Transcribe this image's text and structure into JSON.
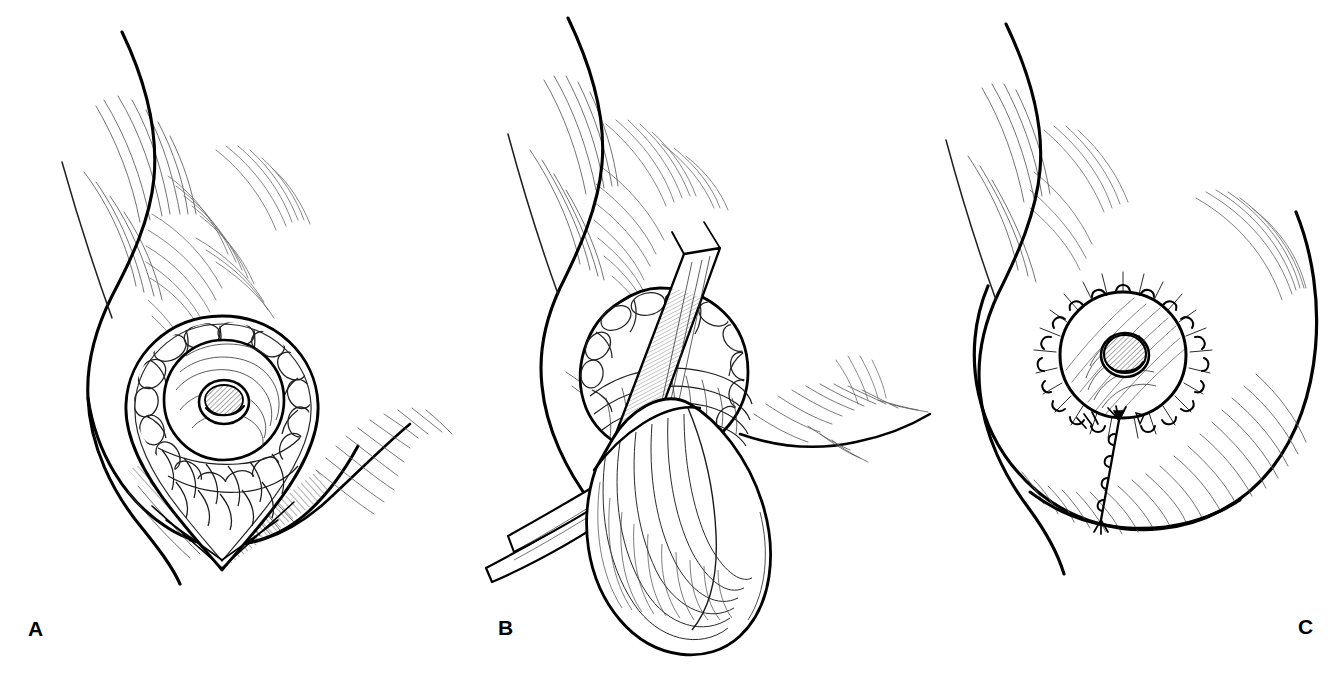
{
  "figure": {
    "type": "pen-and-ink medical illustration",
    "background_color": "#ffffff",
    "ink_color": "#000000",
    "panel_count": 3
  },
  "panels": [
    {
      "label": "A",
      "caption": "Teardrop periareolar incision marked around nipple-areola complex with inferior wedge extension",
      "subject": "female chest, lateral oblique view",
      "features": [
        "breast contour",
        "areola with Montgomery gland cobblestone texture",
        "nipple",
        "teardrop incision outline",
        "inferior V wedge apex",
        "inframammary fold",
        "axillary hatching"
      ]
    },
    {
      "label": "B",
      "caption": "Nipple-areola complex elevated and retracted; glandular tissue dissected with forceps and retractor",
      "subject": "female chest with surgical instruments in field",
      "features": [
        "areola retracted superiorly",
        "double-prong skin hook",
        "tissue forceps",
        "large retracted tissue flap",
        "exposed glandular plane",
        "axillary hatching"
      ]
    },
    {
      "label": "C",
      "caption": "Completed closure: interrupted periareolar sutures with vertical suture line to inframammary fold",
      "subject": "female chest, healed closure",
      "features": [
        "circular areola",
        "nipple",
        "interrupted periareolar sutures",
        "radiating suture tails",
        "vertical running suture line",
        "inframammary fold",
        "breast contour shading"
      ]
    }
  ],
  "labels": {
    "a": "A",
    "b": "B",
    "c": "C"
  }
}
